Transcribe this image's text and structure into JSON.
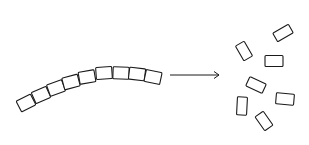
{
  "diagram": {
    "stroke_color": "#1a1a1a",
    "background": "#ffffff",
    "chain": {
      "segment_count": 9,
      "segments": [
        {
          "cx": 26,
          "cy": 103,
          "angle": -27
        },
        {
          "cx": 41,
          "cy": 95,
          "angle": -24
        },
        {
          "cx": 56,
          "cy": 88,
          "angle": -20
        },
        {
          "cx": 71,
          "cy": 82,
          "angle": -15
        },
        {
          "cx": 87,
          "cy": 77,
          "angle": -10
        },
        {
          "cx": 104,
          "cy": 73,
          "angle": -4
        },
        {
          "cx": 121,
          "cy": 73,
          "angle": 2
        },
        {
          "cx": 137,
          "cy": 74,
          "angle": 7
        },
        {
          "cx": 153,
          "cy": 77,
          "angle": 12
        }
      ],
      "segment_width": 16,
      "segment_height": 12
    },
    "arrow": {
      "x1": 170,
      "y1": 75,
      "x2": 219,
      "y2": 75,
      "direction": "right"
    },
    "scattered": [
      {
        "cx": 283,
        "cy": 33,
        "w": 18,
        "h": 10,
        "angle": -30
      },
      {
        "cx": 244,
        "cy": 51,
        "w": 10,
        "h": 17,
        "angle": -30
      },
      {
        "cx": 274,
        "cy": 61,
        "w": 18,
        "h": 11,
        "angle": 0
      },
      {
        "cx": 256,
        "cy": 85,
        "w": 18,
        "h": 10,
        "angle": 25
      },
      {
        "cx": 285,
        "cy": 99,
        "w": 18,
        "h": 11,
        "angle": 5
      },
      {
        "cx": 242,
        "cy": 106,
        "w": 10,
        "h": 18,
        "angle": 3
      },
      {
        "cx": 264,
        "cy": 121,
        "w": 10,
        "h": 17,
        "angle": -35
      }
    ]
  }
}
